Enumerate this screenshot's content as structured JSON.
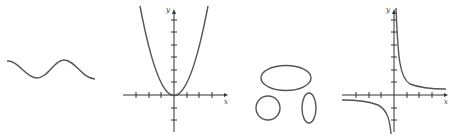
{
  "figures": [
    {
      "id": "a",
      "kind": "sine-like wave",
      "has_axes": false
    },
    {
      "id": "b",
      "kind": "parabola",
      "equation_hint": "y = x^2",
      "has_axes": true,
      "x_label": "x",
      "y_label": "y"
    },
    {
      "id": "c",
      "kind": "three closed curves",
      "shapes": [
        "horizontal ellipse",
        "circle",
        "vertical ellipse"
      ],
      "has_axes": false
    },
    {
      "id": "d",
      "kind": "hyperbola",
      "equation_hint": "y = 1/x",
      "has_axes": true,
      "x_label": "x",
      "y_label": "y"
    }
  ],
  "colors": {
    "curve": "#555555",
    "axis": "#333333",
    "background": "#ffffff"
  }
}
